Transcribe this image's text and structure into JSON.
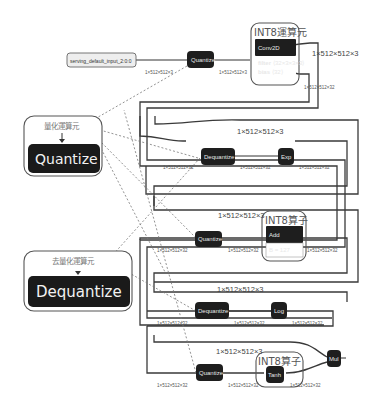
{
  "input_node": {
    "label": "serving_default_input_2:0:0"
  },
  "legends": {
    "quantize": {
      "caption": "量化運算元",
      "node_label": "Quantize"
    },
    "dequantize": {
      "caption": "去量化運算元",
      "node_label": "Dequantize"
    }
  },
  "int8_groups": {
    "conv": {
      "title": "INT8運算元"
    },
    "add": {
      "title": "INT8算子"
    },
    "tanh": {
      "title": "INT8算子"
    }
  },
  "nodes": {
    "quantize_top": "Quantize",
    "conv2d": "Conv2D",
    "conv2d_filter_key": "filter",
    "conv2d_filter_val": "⟨32×3×3×3⟩",
    "conv2d_bias_key": "bias",
    "conv2d_bias_val": "⟨32⟩",
    "dequantize_1": "Dequantize",
    "exp": "Exp",
    "quantize_2": "Quantize",
    "add": "Add",
    "add_attr": "B = 127",
    "dequantize_3": "Dequantize",
    "log": "Log",
    "quantize_4": "Quantize",
    "tanh": "Tanh",
    "mul": "Mul"
  },
  "shapes": {
    "s3": "1×512×512×3",
    "s32": "1×512×512×32"
  },
  "edge_labels": {
    "input_to_quant": "1×512×512×3",
    "quant_to_conv": "1×512×512×3",
    "conv_rail_3": "1×512×512×3",
    "conv_out_32": "1×512×512×32",
    "row1_rail": "1×512×512×3",
    "row1_in": "1×512×512×32",
    "row1_mid": "1×512×512×32",
    "row1_out": "1×512×512×32",
    "row2_rail": "1×512×512×3",
    "row2_in": "1×512×512×32",
    "row2_mid": "1×512×512×32",
    "row2_out": "1×512×512×32",
    "row3_rail": "1×512×512×3",
    "row3_in": "1×512×512×32",
    "row3_mid": "1×512×512×32",
    "row3_out": "1×512×512×32",
    "row4_rail": "1×512×512×3",
    "row4_in": "1×512×512×32",
    "row4_mid": "1×512×512×32",
    "row4_out": "1×512×512×32"
  }
}
